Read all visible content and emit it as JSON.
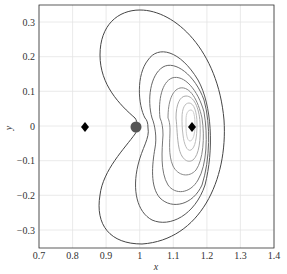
{
  "chart_data": {
    "type": "contour",
    "title": "",
    "xlabel": "x",
    "ylabel": "y",
    "xlim": [
      0.7,
      1.4
    ],
    "ylim": [
      -0.35,
      0.35
    ],
    "xticks": [
      "0.7",
      "0.8",
      "0.9",
      "1",
      "1.1",
      "1.2",
      "1.3",
      "1.4"
    ],
    "yticks": [
      "0.3",
      "0.2",
      "0.1",
      "0",
      "-0.1",
      "-0.2",
      "-0.3"
    ],
    "grid": true,
    "markers": [
      {
        "shape": "diamond",
        "x": 0.836,
        "y": 0
      },
      {
        "shape": "circle",
        "x": 0.988,
        "y": 0
      },
      {
        "shape": "diamond",
        "x": 1.156,
        "y": 0
      }
    ],
    "contour_levels": 8,
    "contour_colors": [
      "#444444",
      "#555555",
      "#666666",
      "#777777",
      "#888888",
      "#aaaaaa",
      "#bbbbbb",
      "#cccccc"
    ]
  },
  "axes": {
    "xlabel": "x",
    "ylabel": "y",
    "xticks": [
      {
        "label": "0.7",
        "px": 39
      },
      {
        "label": "0.8",
        "px": 72.6
      },
      {
        "label": "0.9",
        "px": 106.1
      },
      {
        "label": "1",
        "px": 139.7
      },
      {
        "label": "1.1",
        "px": 173.3
      },
      {
        "label": "1.2",
        "px": 206.9
      },
      {
        "label": "1.3",
        "px": 240.4
      },
      {
        "label": "1.4",
        "px": 274
      }
    ],
    "yticks": [
      {
        "label": "0.3",
        "py": 22
      },
      {
        "label": "0.2",
        "py": 56.7
      },
      {
        "label": "0.1",
        "py": 91.3
      },
      {
        "label": "0",
        "py": 126
      },
      {
        "label": "−0.1",
        "py": 160.7
      },
      {
        "label": "−0.2",
        "py": 195.3
      },
      {
        "label": "−0.3",
        "py": 230
      }
    ]
  }
}
